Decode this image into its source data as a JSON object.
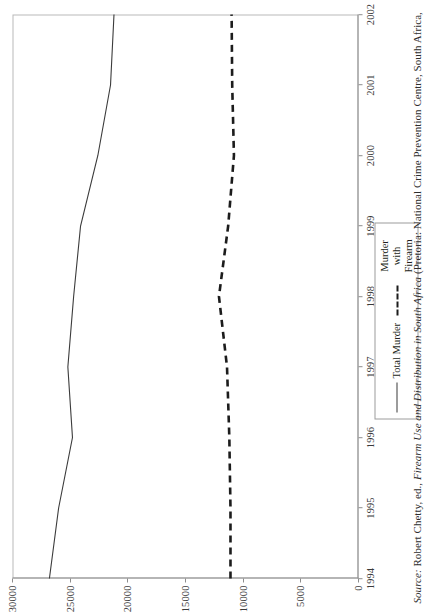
{
  "figure": {
    "legend": {
      "entries": [
        {
          "label": "Total Murder",
          "style": "solid"
        },
        {
          "label": "Murder with Firearm",
          "style": "dashed"
        }
      ]
    },
    "source_note": {
      "prefix": "Source:",
      "author": " Robert Chetty, ed., ",
      "title": "Firearm Use and Distribution in South Africa",
      "publication": " (Pretoria: National Crime Prevention Centre, South Africa,"
    }
  },
  "chart_data": {
    "type": "line",
    "title": "",
    "xlabel": "",
    "ylabel": "",
    "x": [
      1994,
      1995,
      1996,
      1997,
      1998,
      1999,
      2000,
      2001,
      2002
    ],
    "xtick_labels": [
      "1994",
      "1995",
      "1996",
      "1997",
      "1998",
      "1999",
      "2000",
      "2001",
      "2002"
    ],
    "ytick_labels": [
      "0",
      "5000",
      "10000",
      "15000",
      "20000",
      "25000",
      "30000"
    ],
    "yticks": [
      0,
      5000,
      10000,
      15000,
      20000,
      25000,
      30000
    ],
    "xlim": [
      1994,
      2002
    ],
    "ylim": [
      0,
      30000
    ],
    "grid": false,
    "legend_position": "below-plot-center",
    "series": [
      {
        "name": "Total Murder",
        "style": "solid",
        "color": "#3b3b3b",
        "values": [
          26800,
          26000,
          24800,
          25200,
          24700,
          24100,
          22600,
          21500,
          21200
        ]
      },
      {
        "name": "Murder with Firearm",
        "style": "dashed",
        "color": "#1c1c1c",
        "values": [
          11100,
          11100,
          11200,
          11400,
          12100,
          11300,
          10800,
          10950,
          11000
        ]
      }
    ]
  }
}
